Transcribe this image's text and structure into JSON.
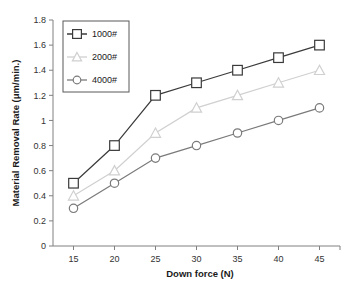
{
  "chart_data": {
    "type": "line",
    "title": "",
    "xlabel": "Down force (N)",
    "ylabel": "Material Removal Rate  (μm/min.)",
    "x": [
      15,
      20,
      25,
      30,
      35,
      40,
      45
    ],
    "xticklabels": [
      "15",
      "20",
      "25",
      "30",
      "35",
      "40",
      "45"
    ],
    "yticklabels": [
      "0",
      "0.2",
      "0.4",
      "0.6",
      "0.8",
      "1",
      "1.2",
      "1.4",
      "1.6",
      "1.8"
    ],
    "yticks": [
      0,
      0.2,
      0.4,
      0.6,
      0.8,
      1.0,
      1.2,
      1.4,
      1.6,
      1.8
    ],
    "xlim": [
      12.5,
      47.5
    ],
    "ylim": [
      0,
      1.8
    ],
    "grid": false,
    "legend_position": "upper-left-inside",
    "series": [
      {
        "name": "1000#",
        "values": [
          0.5,
          0.8,
          1.2,
          1.3,
          1.4,
          1.5,
          1.6
        ],
        "color": "#3a3a3a",
        "marker": "square"
      },
      {
        "name": "2000#",
        "values": [
          0.4,
          0.6,
          0.9,
          1.1,
          1.2,
          1.3,
          1.4
        ],
        "color": "#d0d0d0",
        "marker": "triangle"
      },
      {
        "name": "4000#",
        "values": [
          0.3,
          0.5,
          0.7,
          0.8,
          0.9,
          1.0,
          1.1
        ],
        "color": "#7a7a7a",
        "marker": "circle"
      }
    ]
  },
  "axis": {
    "x_title": "Down force (N)",
    "y_title": "Material Removal Rate  (μm/min.)"
  },
  "legend": {
    "items": [
      {
        "label": "1000#"
      },
      {
        "label": "2000#"
      },
      {
        "label": "4000#"
      }
    ]
  }
}
